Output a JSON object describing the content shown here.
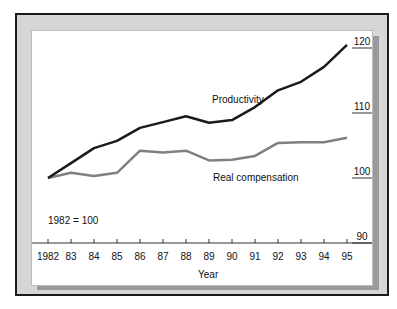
{
  "chart_data": {
    "type": "line",
    "title": "",
    "xlabel": "Year",
    "ylabel": "",
    "x": [
      "1982",
      "83",
      "84",
      "85",
      "86",
      "87",
      "88",
      "89",
      "90",
      "91",
      "92",
      "93",
      "94",
      "95"
    ],
    "series": [
      {
        "name": "Productivity",
        "color": "#1a1a1a",
        "values": [
          100,
          102.3,
          104.6,
          105.7,
          107.7,
          108.6,
          109.5,
          108.5,
          108.9,
          110.9,
          113.5,
          114.8,
          117.1,
          120.5
        ]
      },
      {
        "name": "Real compensation",
        "color": "#808080",
        "values": [
          100,
          100.8,
          100.3,
          100.8,
          104.2,
          103.9,
          104.2,
          102.7,
          102.8,
          103.4,
          105.4,
          105.5,
          105.5,
          106.2
        ]
      }
    ],
    "ylim": [
      90,
      120
    ],
    "yticks": [
      "90",
      "100",
      "110",
      "120"
    ],
    "y_axis_position": "right",
    "grid": false,
    "annotations": [
      "1982 = 100",
      "Productivity",
      "Real compensation"
    ]
  },
  "labels": {
    "base_note": "1982 = 100",
    "productivity": "Productivity",
    "real_comp": "Real compensation",
    "xlabel": "Year"
  }
}
